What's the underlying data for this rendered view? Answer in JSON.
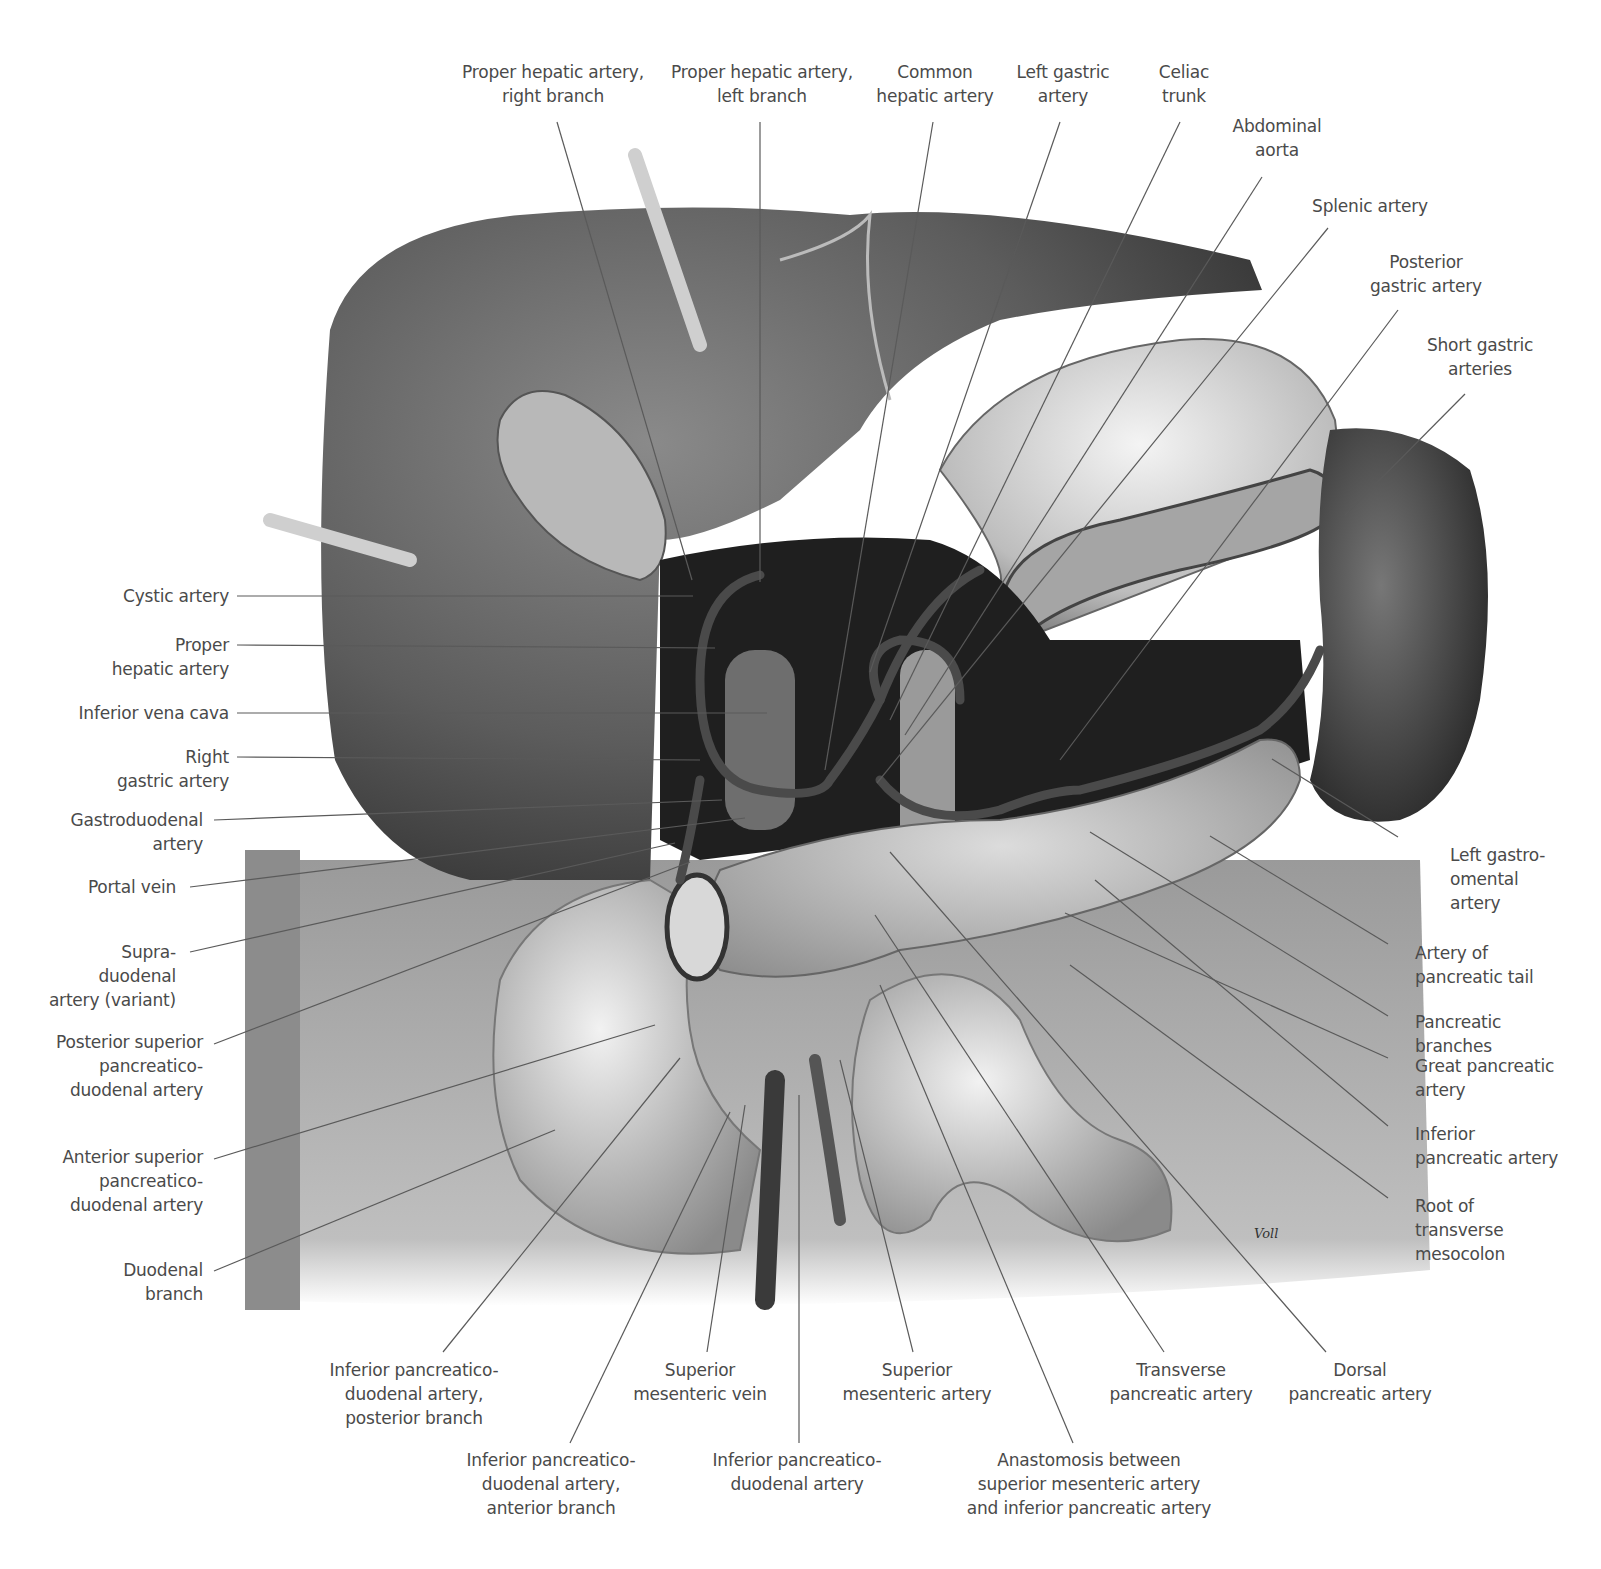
{
  "figure": {
    "signature": "Voll",
    "colors": {
      "background": "#ffffff",
      "label_text": "#4a4a4a",
      "leader_line": "#5a5a5a"
    }
  },
  "labels": {
    "top": [
      {
        "id": "proper-hepatic-right",
        "text": "Proper hepatic artery,\nright branch",
        "x": 553,
        "y": 58
      },
      {
        "id": "proper-hepatic-left",
        "text": "Proper hepatic artery,\nleft branch",
        "x": 762,
        "y": 58
      },
      {
        "id": "common-hepatic",
        "text": "Common\nhepatic artery",
        "x": 935,
        "y": 58
      },
      {
        "id": "left-gastric",
        "text": "Left gastric\nartery",
        "x": 1063,
        "y": 58
      },
      {
        "id": "celiac-trunk",
        "text": "Celiac\ntrunk",
        "x": 1184,
        "y": 58
      },
      {
        "id": "abdominal-aorta",
        "text": "Abdominal\naorta",
        "x": 1277,
        "y": 113
      },
      {
        "id": "splenic-artery",
        "text": "Splenic artery",
        "x": 1370,
        "y": 193
      },
      {
        "id": "posterior-gastric",
        "text": "Posterior\ngastric artery",
        "x": 1426,
        "y": 250
      },
      {
        "id": "short-gastric",
        "text": "Short gastric\narteries",
        "x": 1480,
        "y": 333
      }
    ],
    "left": [
      {
        "id": "cystic-artery",
        "text": "Cystic artery",
        "x": 229,
        "y": 584
      },
      {
        "id": "proper-hepatic",
        "text": "Proper\nhepatic artery",
        "x": 229,
        "y": 633
      },
      {
        "id": "inferior-vena-cava",
        "text": "Inferior vena cava",
        "x": 229,
        "y": 701
      },
      {
        "id": "right-gastric",
        "text": "Right\ngastric artery",
        "x": 229,
        "y": 745
      },
      {
        "id": "gastroduodenal",
        "text": "Gastroduodenal\nartery",
        "x": 203,
        "y": 808
      },
      {
        "id": "portal-vein",
        "text": "Portal vein",
        "x": 176,
        "y": 875
      },
      {
        "id": "supraduodenal",
        "text": "Supra-\nduodenal\nartery (variant)",
        "x": 176,
        "y": 940
      },
      {
        "id": "posterior-superior-pd",
        "text": "Posterior superior\npancreatico-\nduodenal artery",
        "x": 203,
        "y": 1030
      },
      {
        "id": "anterior-superior-pd",
        "text": "Anterior superior\npancreatico-\nduodenal artery",
        "x": 203,
        "y": 1145
      },
      {
        "id": "duodenal-branch",
        "text": "Duodenal\nbranch",
        "x": 203,
        "y": 1258
      }
    ],
    "right": [
      {
        "id": "left-gastroomental",
        "text": "Left gastro-\nomental\nartery",
        "x": 1450,
        "y": 843
      },
      {
        "id": "artery-pancreatic-tail",
        "text": "Artery of\npancreatic tail",
        "x": 1415,
        "y": 941
      },
      {
        "id": "pancreatic-branches",
        "text": "Pancreatic\nbranches",
        "x": 1415,
        "y": 1010
      },
      {
        "id": "great-pancreatic",
        "text": "Great pancreatic\nartery",
        "x": 1415,
        "y": 1054
      },
      {
        "id": "inferior-pancreatic",
        "text": "Inferior\npancreatic artery",
        "x": 1415,
        "y": 1122
      },
      {
        "id": "root-transverse-mesocolon",
        "text": "Root of\ntransverse\nmesocolon",
        "x": 1415,
        "y": 1194
      }
    ],
    "bottom": [
      {
        "id": "inferior-pd-posterior",
        "text": "Inferior pancreatico-\nduodenal artery,\nposterior branch",
        "x": 414,
        "y": 1358
      },
      {
        "id": "superior-mesenteric-vein",
        "text": "Superior\nmesenteric vein",
        "x": 700,
        "y": 1358
      },
      {
        "id": "superior-mesenteric-artery",
        "text": "Superior\nmesenteric artery",
        "x": 917,
        "y": 1358
      },
      {
        "id": "transverse-pancreatic",
        "text": "Transverse\npancreatic artery",
        "x": 1181,
        "y": 1358
      },
      {
        "id": "dorsal-pancreatic",
        "text": "Dorsal\npancreatic artery",
        "x": 1360,
        "y": 1358
      },
      {
        "id": "inferior-pd-anterior",
        "text": "Inferior pancreatico-\nduodenal artery,\nanterior branch",
        "x": 551,
        "y": 1448
      },
      {
        "id": "inferior-pd",
        "text": "Inferior pancreatico-\nduodenal artery",
        "x": 797,
        "y": 1448
      },
      {
        "id": "anastomosis",
        "text": "Anastomosis between\nsuperior mesenteric artery\nand inferior pancreatic artery",
        "x": 1089,
        "y": 1448
      }
    ]
  }
}
